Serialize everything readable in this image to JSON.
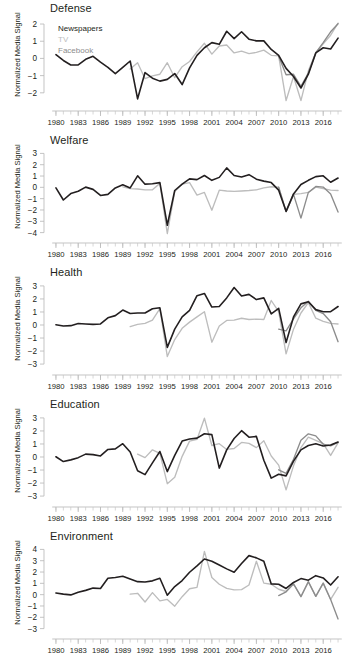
{
  "figure": {
    "ylabel": "Normalized Media Signal",
    "xlabel": "",
    "x_tick_labels": [
      "1980",
      "1983",
      "1986",
      "1989",
      "1992",
      "1995",
      "1998",
      "2001",
      "2004",
      "2007",
      "2010",
      "2013",
      "2016"
    ],
    "x_tick_values": [
      1980,
      1983,
      1986,
      1989,
      1992,
      1995,
      1998,
      2001,
      2004,
      2007,
      2010,
      2013,
      2016
    ],
    "xlim": [
      1979.2,
      2018.8
    ]
  },
  "legend": {
    "position": "top-left of first panel",
    "entries": [
      {
        "label": "Newspapers",
        "color": "#231f20"
      },
      {
        "label": "TV",
        "color": "#bdbdbd"
      },
      {
        "label": "Facebook",
        "color": "#8c8c8c"
      }
    ]
  },
  "colors": {
    "newspapers": "#231f20",
    "tv": "#bdbdbd",
    "facebook": "#8c8c8c",
    "axis": "#b9b9b9",
    "text": "#231f20",
    "background": "#ffffff"
  },
  "chart_data": [
    {
      "type": "line",
      "title": "Defense",
      "xlabel": "",
      "ylabel": "Normalized Media Signal",
      "xlim": [
        1979.2,
        2018.8
      ],
      "ylim": [
        -2.65,
        2.35
      ],
      "y_ticks": [
        -2,
        -1,
        0,
        1,
        2
      ],
      "grid": false,
      "legend_position": "upper-left",
      "series": [
        {
          "name": "Newspapers",
          "color": "#231f20",
          "x": [
            1980,
            1981,
            1982,
            1983,
            1984,
            1985,
            1986,
            1987,
            1988,
            1989,
            1990,
            1991,
            1992,
            1993,
            1994,
            1995,
            1996,
            1997,
            1998,
            1999,
            2000,
            2001,
            2002,
            2003,
            2004,
            2005,
            2006,
            2007,
            2008,
            2009,
            2010,
            2011,
            2012,
            2013,
            2014,
            2015,
            2016,
            2017,
            2018
          ],
          "values": [
            0.22,
            -0.12,
            -0.38,
            -0.38,
            -0.05,
            0.12,
            -0.22,
            -0.52,
            -0.88,
            -0.52,
            -0.15,
            -2.35,
            -0.82,
            -1.15,
            -1.32,
            -1.22,
            -0.88,
            -1.52,
            -0.55,
            0.18,
            0.62,
            0.92,
            0.82,
            1.58,
            1.15,
            1.55,
            1.12,
            1.02,
            1.02,
            0.52,
            0.18,
            -0.58,
            -1.05,
            -1.72,
            -0.92,
            0.32,
            0.62,
            0.55,
            1.18
          ]
        },
        {
          "name": "TV",
          "color": "#bdbdbd",
          "x": [
            1990,
            1991,
            1992,
            1993,
            1994,
            1995,
            1996,
            1997,
            1998,
            1999,
            2000,
            2001,
            2002,
            2003,
            2004,
            2005,
            2006,
            2007,
            2008,
            2009,
            2010,
            2011,
            2012,
            2013,
            2014,
            2015,
            2016,
            2017,
            2018
          ],
          "values": [
            -0.62,
            -0.25,
            -1.18,
            -1.02,
            -0.92,
            -0.25,
            -1.12,
            -0.48,
            -0.18,
            0.38,
            0.88,
            0.25,
            0.72,
            0.78,
            0.32,
            0.42,
            0.28,
            0.35,
            0.48,
            0.18,
            0.15,
            -2.45,
            -1.05,
            -2.45,
            -0.72,
            0.35,
            0.85,
            1.35,
            2.05
          ]
        },
        {
          "name": "Facebook",
          "color": "#8c8c8c",
          "x": [
            2010,
            2011,
            2012,
            2013,
            2014,
            2015,
            2016,
            2017,
            2018
          ],
          "values": [
            0.12,
            -0.95,
            -0.92,
            -1.62,
            -0.85,
            0.32,
            0.92,
            1.55,
            2.02
          ]
        }
      ]
    },
    {
      "type": "line",
      "title": "Welfare",
      "xlabel": "",
      "ylabel": "Normalized Media Signal",
      "xlim": [
        1979.2,
        2018.8
      ],
      "ylim": [
        -4.3,
        3.3
      ],
      "y_ticks": [
        -4,
        -3,
        -2,
        -1,
        0,
        1,
        2,
        3
      ],
      "grid": false,
      "series": [
        {
          "name": "Newspapers",
          "color": "#231f20",
          "x": [
            1980,
            1981,
            1982,
            1983,
            1984,
            1985,
            1986,
            1987,
            1988,
            1989,
            1990,
            1991,
            1992,
            1993,
            1994,
            1995,
            1996,
            1997,
            1998,
            1999,
            2000,
            2001,
            2002,
            2003,
            2004,
            2005,
            2006,
            2007,
            2008,
            2009,
            2010,
            2011,
            2012,
            2013,
            2014,
            2015,
            2016,
            2017,
            2018
          ],
          "values": [
            -0.05,
            -1.12,
            -0.55,
            -0.35,
            0.02,
            -0.18,
            -0.72,
            -0.62,
            -0.05,
            0.22,
            -0.05,
            1.02,
            0.28,
            0.32,
            0.42,
            -3.35,
            -0.28,
            0.28,
            0.75,
            0.68,
            1.05,
            0.62,
            0.88,
            1.72,
            1.05,
            0.92,
            1.12,
            0.72,
            0.55,
            0.42,
            -0.25,
            -2.12,
            -0.58,
            0.25,
            0.62,
            0.95,
            1.02,
            0.45,
            0.82
          ]
        },
        {
          "name": "TV",
          "color": "#bdbdbd",
          "x": [
            1989,
            1990,
            1991,
            1992,
            1993,
            1994,
            1995,
            1996,
            1997,
            1998,
            1999,
            2000,
            2001,
            2002,
            2003,
            2004,
            2005,
            2006,
            2007,
            2008,
            2009,
            2010,
            2011,
            2012,
            2013,
            2014,
            2015,
            2016,
            2017,
            2018
          ],
          "values": [
            0.05,
            -0.12,
            -0.15,
            -0.22,
            -0.22,
            0.35,
            -4.08,
            -0.38,
            0.28,
            0.42,
            -0.68,
            -0.45,
            -2.02,
            -0.25,
            -0.32,
            -0.35,
            -0.32,
            -0.28,
            -0.22,
            -0.05,
            0.05,
            0.02,
            -2.15,
            -0.62,
            -0.55,
            -0.45,
            0.02,
            -0.12,
            -0.25,
            -0.28
          ]
        },
        {
          "name": "Facebook",
          "color": "#8c8c8c",
          "x": [
            2010,
            2011,
            2012,
            2013,
            2014,
            2015,
            2016,
            2017,
            2018
          ],
          "values": [
            0.02,
            -2.15,
            -0.62,
            -2.72,
            -0.45,
            0.08,
            0.02,
            -0.58,
            -2.18
          ]
        }
      ]
    },
    {
      "type": "line",
      "title": "Health",
      "xlabel": "",
      "ylabel": "Normalized Media Signal",
      "xlim": [
        1979.2,
        2018.8
      ],
      "ylim": [
        -3.3,
        3.3
      ],
      "y_ticks": [
        -3,
        -2,
        -1,
        0,
        1,
        2,
        3
      ],
      "grid": false,
      "series": [
        {
          "name": "Newspapers",
          "color": "#231f20",
          "x": [
            1980,
            1981,
            1982,
            1983,
            1984,
            1985,
            1986,
            1987,
            1988,
            1989,
            1990,
            1991,
            1992,
            1993,
            1994,
            1995,
            1996,
            1997,
            1998,
            1999,
            2000,
            2001,
            2002,
            2003,
            2004,
            2005,
            2006,
            2007,
            2008,
            2009,
            2010,
            2011,
            2012,
            2013,
            2014,
            2015,
            2016,
            2017,
            2018
          ],
          "values": [
            0.02,
            -0.08,
            -0.05,
            0.12,
            0.08,
            0.05,
            0.08,
            0.55,
            0.72,
            1.15,
            0.88,
            0.92,
            0.92,
            1.25,
            1.32,
            -1.72,
            -0.32,
            0.62,
            1.12,
            2.25,
            2.42,
            1.38,
            1.42,
            2.08,
            2.88,
            2.22,
            2.35,
            1.95,
            2.08,
            0.85,
            1.28,
            -1.35,
            0.62,
            1.62,
            1.78,
            1.18,
            1.02,
            1.02,
            1.42
          ]
        },
        {
          "name": "TV",
          "color": "#bdbdbd",
          "x": [
            1990,
            1991,
            1992,
            1993,
            1994,
            1995,
            1996,
            1997,
            1998,
            1999,
            2000,
            2001,
            2002,
            2003,
            2004,
            2005,
            2006,
            2007,
            2008,
            2009,
            2010,
            2011,
            2012,
            2013,
            2014,
            2015,
            2016,
            2017,
            2018
          ],
          "values": [
            -0.12,
            0.05,
            0.12,
            0.38,
            1.25,
            -2.42,
            -1.12,
            -0.25,
            0.22,
            0.62,
            1.02,
            -1.32,
            -0.08,
            0.35,
            0.38,
            0.52,
            0.42,
            0.45,
            0.42,
            1.88,
            1.02,
            -2.22,
            -0.32,
            0.92,
            1.72,
            0.52,
            0.28,
            0.12,
            0.08
          ]
        },
        {
          "name": "Facebook",
          "color": "#8c8c8c",
          "x": [
            2010,
            2011,
            2012,
            2013,
            2014,
            2015,
            2016,
            2017,
            2018
          ],
          "values": [
            -0.32,
            -0.45,
            0.48,
            1.32,
            1.82,
            1.12,
            0.88,
            0.25,
            -1.28
          ]
        }
      ]
    },
    {
      "type": "line",
      "title": "Education",
      "xlabel": "",
      "ylabel": "Normalized Media Signal",
      "xlim": [
        1979.2,
        2018.8
      ],
      "ylim": [
        -3.3,
        3.3
      ],
      "y_ticks": [
        -3,
        -2,
        -1,
        0,
        1,
        2,
        3
      ],
      "grid": false,
      "series": [
        {
          "name": "Newspapers",
          "color": "#231f20",
          "x": [
            1980,
            1981,
            1982,
            1983,
            1984,
            1985,
            1986,
            1987,
            1988,
            1989,
            1990,
            1991,
            1992,
            1993,
            1994,
            1995,
            1996,
            1997,
            1998,
            1999,
            2000,
            2001,
            2002,
            2003,
            2004,
            2005,
            2006,
            2007,
            2008,
            2009,
            2010,
            2011,
            2012,
            2013,
            2014,
            2015,
            2016,
            2017,
            2018
          ],
          "values": [
            0.02,
            -0.35,
            -0.22,
            -0.05,
            0.22,
            0.18,
            0.08,
            0.58,
            0.62,
            1.02,
            0.38,
            -1.05,
            -1.35,
            -0.45,
            0.42,
            -1.12,
            0.12,
            1.22,
            1.38,
            1.45,
            1.78,
            1.72,
            -0.85,
            0.55,
            1.42,
            2.02,
            1.52,
            1.58,
            -0.25,
            -1.62,
            -1.32,
            -1.45,
            -0.32,
            0.55,
            0.88,
            1.02,
            0.85,
            0.92,
            1.15
          ]
        },
        {
          "name": "TV",
          "color": "#bdbdbd",
          "x": [
            1991,
            1992,
            1993,
            1994,
            1995,
            1996,
            1997,
            1998,
            1999,
            2000,
            2001,
            2002,
            2003,
            2004,
            2005,
            2006,
            2007,
            2008,
            2009,
            2010,
            2011,
            2012,
            2013,
            2014,
            2015,
            2016,
            2017,
            2018
          ],
          "values": [
            0.22,
            -0.05,
            0.55,
            0.28,
            -2.05,
            -1.55,
            0.05,
            1.22,
            1.35,
            2.98,
            0.88,
            1.02,
            0.58,
            0.65,
            1.12,
            1.05,
            0.72,
            1.25,
            0.08,
            -0.62,
            -2.52,
            -0.68,
            0.72,
            1.52,
            1.28,
            1.02,
            0.12,
            1.08
          ]
        },
        {
          "name": "Facebook",
          "color": "#8c8c8c",
          "x": [
            2010,
            2011,
            2012,
            2013,
            2014,
            2015,
            2016,
            2017,
            2018
          ],
          "values": [
            -0.98,
            -1.25,
            -0.18,
            1.28,
            1.78,
            1.62,
            0.98,
            0.85,
            1.12
          ]
        }
      ]
    },
    {
      "type": "line",
      "title": "Environment",
      "xlabel": "",
      "ylabel": "Normalized Media Signal",
      "xlim": [
        1979.2,
        2018.8
      ],
      "ylim": [
        -3.3,
        4.3
      ],
      "y_ticks": [
        -3,
        -2,
        -1,
        0,
        1,
        2,
        3,
        4
      ],
      "grid": false,
      "series": [
        {
          "name": "Newspapers",
          "color": "#231f20",
          "x": [
            1980,
            1981,
            1982,
            1983,
            1984,
            1985,
            1986,
            1987,
            1988,
            1989,
            1990,
            1991,
            1992,
            1993,
            1994,
            1995,
            1996,
            1997,
            1998,
            1999,
            2000,
            2001,
            2002,
            2003,
            2004,
            2005,
            2006,
            2007,
            2008,
            2009,
            2010,
            2011,
            2012,
            2013,
            2014,
            2015,
            2016,
            2017,
            2018
          ],
          "values": [
            0.15,
            0.05,
            -0.02,
            0.22,
            0.38,
            0.58,
            0.55,
            1.45,
            1.52,
            1.62,
            1.38,
            1.15,
            1.12,
            1.22,
            1.45,
            -0.05,
            0.72,
            1.25,
            1.98,
            2.55,
            3.15,
            2.95,
            2.62,
            2.28,
            1.98,
            2.75,
            3.45,
            3.25,
            2.95,
            0.95,
            0.92,
            0.55,
            1.08,
            1.42,
            1.28,
            1.68,
            1.48,
            0.85,
            1.58
          ]
        },
        {
          "name": "TV",
          "color": "#bdbdbd",
          "x": [
            1990,
            1991,
            1992,
            1993,
            1994,
            1995,
            1996,
            1997,
            1998,
            1999,
            2000,
            2001,
            2002,
            2003,
            2004,
            2005,
            2006,
            2007,
            2008,
            2009,
            2010,
            2011,
            2012,
            2013,
            2014,
            2015,
            2016,
            2017,
            2018
          ],
          "values": [
            0.05,
            0.12,
            -0.65,
            0.18,
            -0.55,
            -0.42,
            -1.02,
            -0.18,
            0.52,
            0.65,
            3.82,
            1.52,
            0.92,
            0.55,
            0.42,
            0.45,
            0.85,
            2.95,
            1.02,
            0.92,
            0.48,
            0.28,
            0.95,
            -0.15,
            1.12,
            -0.15,
            1.02,
            -0.42,
            0.65
          ]
        },
        {
          "name": "Facebook",
          "color": "#8c8c8c",
          "x": [
            2010,
            2011,
            2012,
            2013,
            2014,
            2015,
            2016,
            2017,
            2018
          ],
          "values": [
            -0.08,
            0.25,
            0.95,
            -0.18,
            1.15,
            -0.15,
            1.02,
            -0.42,
            -2.15
          ]
        }
      ]
    }
  ]
}
